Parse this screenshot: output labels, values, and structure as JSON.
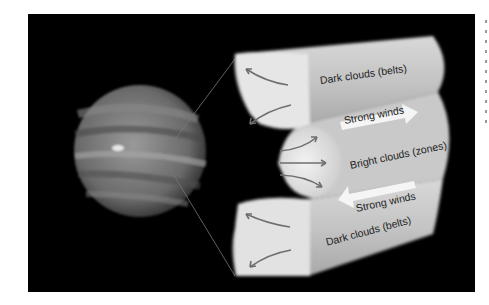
{
  "figure": {
    "labels": {
      "top_belt": "Dark clouds (belts)",
      "top_wind": "Strong winds",
      "zone": "Bright clouds (zones)",
      "bottom_wind": "Strong winds",
      "bottom_belt": "Dark clouds (belts)"
    },
    "colors": {
      "background": "#000000",
      "page": "#ffffff",
      "cloud_light": "#e6e6e6",
      "cloud_mid": "#bdbdbd",
      "arrow": "#6e6e6e",
      "wind_arrow": "#f5f5f5"
    }
  }
}
